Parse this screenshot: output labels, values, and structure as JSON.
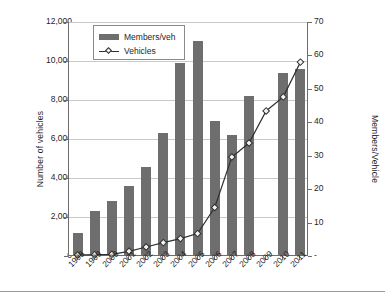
{
  "chart_data": {
    "type": "bar",
    "title": "",
    "xlabel": "",
    "ylabel": "Number of vehicles",
    "y2label": "Members/Vehicle",
    "categories": [
      "1998",
      "1999",
      "2000",
      "2001",
      "2002",
      "2003",
      "2004",
      "2005",
      "2006",
      "2007",
      "2008",
      "2009",
      "2010",
      "2011"
    ],
    "ylim": [
      0,
      12000
    ],
    "y2lim": [
      0,
      70
    ],
    "yticks": [
      "0",
      "2,000",
      "4,000",
      "6,000",
      "8,000",
      "10,000",
      "12,000"
    ],
    "ytick_values": [
      0,
      2000,
      4000,
      6000,
      8000,
      10000,
      12000
    ],
    "y2ticks": [
      "-",
      "10",
      "20",
      "30",
      "40",
      "50",
      "60",
      "70"
    ],
    "y2tick_values": [
      0,
      10,
      20,
      30,
      40,
      50,
      60,
      70
    ],
    "grid": true,
    "legend_position": "top-left-inside",
    "series": [
      {
        "name": "Members/veh",
        "type": "bar",
        "axis": "left",
        "color": "#6e6e6e",
        "values": [
          1150,
          2270,
          2750,
          3530,
          4520,
          6270,
          9850,
          10980,
          6850,
          6140,
          8130,
          0,
          9350,
          9530
        ]
      },
      {
        "name": "Vehicles",
        "type": "line",
        "axis": "right",
        "color": "#2f2f2f",
        "marker": "diamond",
        "values": [
          0.3,
          0.4,
          0.5,
          1.4,
          2.7,
          4.0,
          5.2,
          6.7,
          14.5,
          29.6,
          33.8,
          43.4,
          47.6,
          58.0
        ]
      }
    ]
  },
  "legend": {
    "items": [
      {
        "label": "Members/veh",
        "swatch": "bar"
      },
      {
        "label": "Vehicles",
        "swatch": "line-diamond"
      }
    ]
  },
  "axes": {
    "left_title": "Number of vehicles",
    "right_title": "Members/Vehicle"
  }
}
